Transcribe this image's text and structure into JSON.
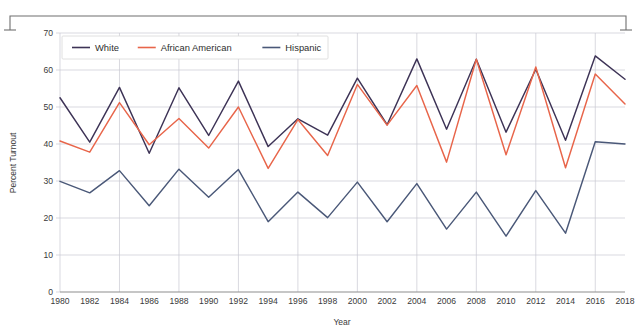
{
  "figure": {
    "background": "#ffffff",
    "frame_color": "#6f6f6f"
  },
  "chart_data": {
    "type": "line",
    "title": "",
    "xlabel": "Year",
    "ylabel": "Percent Turnout",
    "xlim": [
      1980,
      2018
    ],
    "ylim": [
      0,
      70
    ],
    "grid": true,
    "legend_position": "top-left",
    "x": [
      1980,
      1982,
      1984,
      1986,
      1988,
      1990,
      1992,
      1994,
      1996,
      1998,
      2000,
      2002,
      2004,
      2006,
      2008,
      2010,
      2012,
      2014,
      2016,
      2018
    ],
    "xticks": [
      "1980",
      "1982",
      "1984",
      "1986",
      "1988",
      "1990",
      "1992",
      "1994",
      "1996",
      "1998",
      "2000",
      "2002",
      "2004",
      "2006",
      "2008",
      "2010",
      "2012",
      "2014",
      "2016",
      "2018"
    ],
    "yticks": [
      "0",
      "10",
      "20",
      "30",
      "40",
      "50",
      "60",
      "70"
    ],
    "series": [
      {
        "name": "White",
        "color": "#3d3356",
        "values": [
          52.5,
          40.5,
          55.3,
          37.5,
          55.2,
          42.3,
          57.0,
          39.3,
          46.8,
          42.4,
          57.8,
          45.2,
          63.0,
          44.0,
          62.9,
          43.2,
          60.2,
          41.0,
          63.8,
          57.5
        ]
      },
      {
        "name": "African American",
        "color": "#e8654a",
        "values": [
          40.8,
          37.8,
          51.2,
          39.8,
          46.9,
          38.9,
          50.0,
          33.4,
          46.6,
          36.9,
          56.1,
          45.1,
          55.8,
          35.1,
          62.9,
          37.1,
          60.8,
          33.6,
          58.9,
          50.8
        ]
      },
      {
        "name": "Hispanic",
        "color": "#4a5878",
        "values": [
          29.9,
          26.8,
          32.8,
          23.3,
          33.2,
          25.6,
          33.1,
          19.0,
          27.0,
          20.1,
          29.7,
          19.0,
          29.3,
          17.0,
          27.0,
          15.1,
          27.4,
          15.9,
          40.6,
          40.0
        ]
      }
    ]
  },
  "legend": {
    "items": [
      {
        "label": "White",
        "color": "#3d3356"
      },
      {
        "label": "African American",
        "color": "#e8654a"
      },
      {
        "label": "Hispanic",
        "color": "#4a5878"
      }
    ]
  }
}
